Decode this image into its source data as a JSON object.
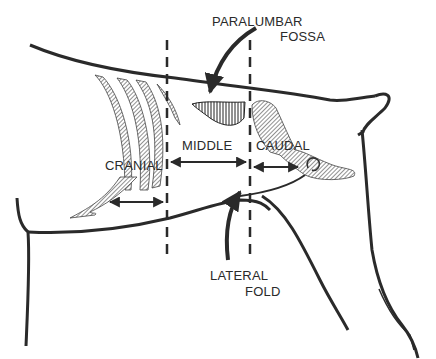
{
  "diagram": {
    "labels": {
      "paralumbar_line1": "PARALUMBAR",
      "paralumbar_line2": "FOSSA",
      "cranial": "CRANIAL",
      "middle": "MIDDLE",
      "caudal": "CAUDAL",
      "lateral_line1": "LATERAL",
      "lateral_line2": "FOLD"
    },
    "colors": {
      "ink": "#2a2a2a",
      "hatch": "#555555",
      "background": "#ffffff"
    }
  }
}
